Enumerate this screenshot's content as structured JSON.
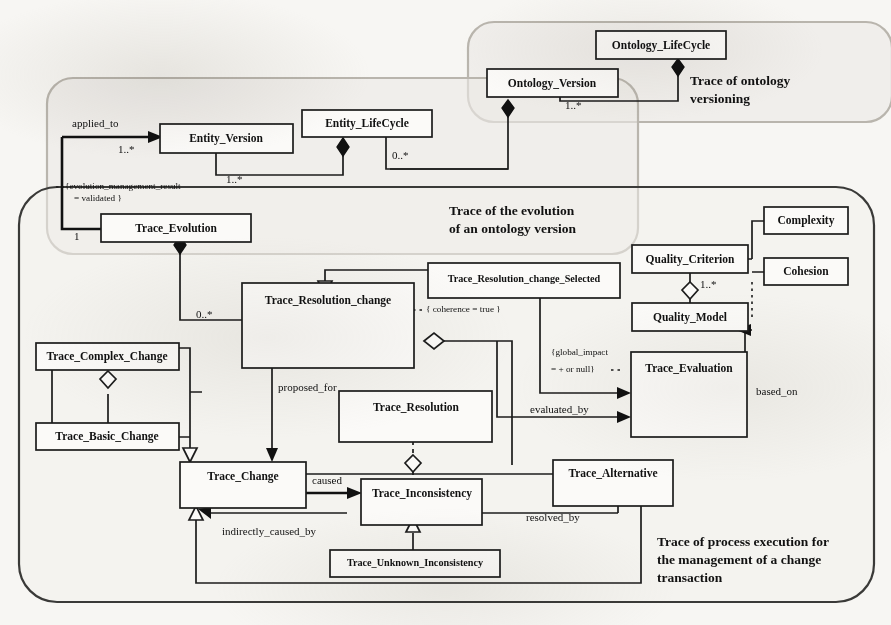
{
  "diagram": {
    "kind": "uml-class-diagram",
    "background_color": "#f7f6f3",
    "line_color": "#1c1c1c",
    "box_fill": "#fbfaf8",
    "group_fill": "#ebe9e5",
    "group_stroke": "#b9b5ad"
  },
  "groups": [
    {
      "id": "ontology-versioning",
      "title_line1": "Trace of ontology",
      "title_line2": "versioning"
    },
    {
      "id": "ontology-evolution",
      "title_line1": "Trace of the evolution",
      "title_line2": "of an ontology version"
    },
    {
      "id": "process-execution",
      "title_line1": "Trace of process execution for",
      "title_line2": "the management of a change",
      "title_line3": "transaction"
    }
  ],
  "classes": {
    "ontology_lifecycle": "Ontology_LifeCycle",
    "ontology_version": "Ontology_Version",
    "entity_lifecycle": "Entity_LifeCycle",
    "entity_version": "Entity_Version",
    "trace_evolution": "Trace_Evolution",
    "trace_resolution_change": "Trace_Resolution_change",
    "trace_resolution_change_selected": "Trace_Resolution_change_Selected",
    "trace_complex_change": "Trace_Complex_Change",
    "trace_basic_change": "Trace_Basic_Change",
    "trace_resolution": "Trace_Resolution",
    "trace_change": "Trace_Change",
    "trace_inconsistency": "Trace_Inconsistency",
    "trace_unknown_inconsistency": "Trace_Unknown_Inconsistency",
    "trace_alternative": "Trace_Alternative",
    "quality_criterion": "Quality_Criterion",
    "quality_model": "Quality_Model",
    "trace_evaluation": "Trace_Evaluation",
    "complexity": "Complexity",
    "cohesion": "Cohesion"
  },
  "role_labels": {
    "applied_to": "applied_to",
    "proposed_for": "proposed_for",
    "evaluated_by": "evaluated_by",
    "based_on": "based_on",
    "caused": "caused",
    "indirectly_caused_by": "indirectly_caused_by",
    "resolved_by": "resolved_by"
  },
  "multiplicities": {
    "ov_olc": "1..*",
    "ev_applied": "1..*",
    "ev_self": "1..*",
    "elc_ev": "0..*",
    "te_one": "1",
    "te_trc": "0..*",
    "qc_qm": "1..*"
  },
  "constraints": {
    "evolution_mgmt_line1": "{evolution_management_result",
    "evolution_mgmt_line2": "= validated }",
    "coherence": "{ coherence = true }",
    "global_impact_line1": "{global_impact",
    "global_impact_line2": "= + or null}"
  }
}
